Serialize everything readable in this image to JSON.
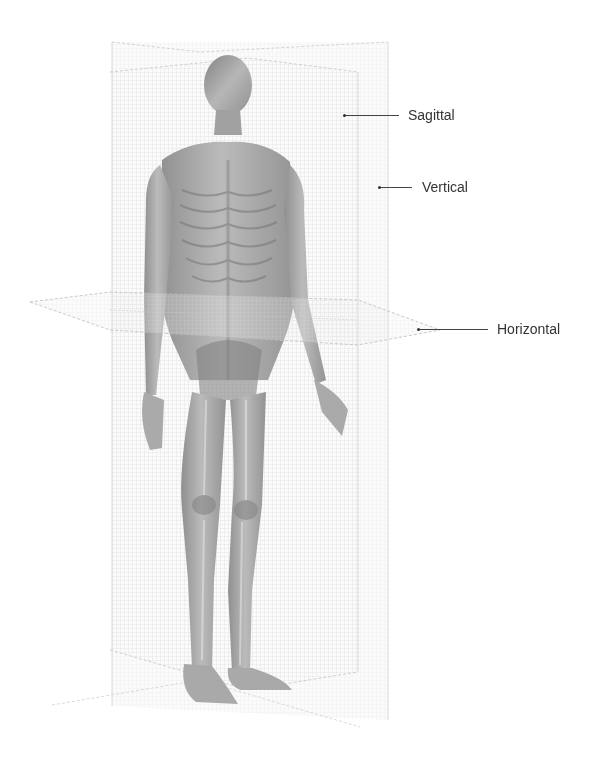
{
  "diagram": {
    "planes": [
      {
        "id": "sagittal",
        "label": "Sagittal"
      },
      {
        "id": "vertical",
        "label": "Vertical"
      },
      {
        "id": "horizontal",
        "label": "Horizontal"
      }
    ],
    "colors": {
      "background": "#ffffff",
      "plane_fill": "#f2f2f2",
      "plane_grid": "#d9d9d9",
      "plane_edge": "#bdbdbd",
      "body": "#9a9a9a",
      "body_dark": "#6e6e6e",
      "label_text": "#333333",
      "leader_line": "#444444"
    }
  }
}
